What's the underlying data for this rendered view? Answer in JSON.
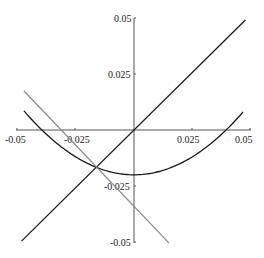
{
  "chart_data": {
    "type": "line",
    "title": "",
    "xlabel": "",
    "ylabel": "",
    "xlim": [
      -0.05,
      0.05
    ],
    "ylim": [
      -0.05,
      0.05
    ],
    "grid": false,
    "legend": null,
    "x_ticks": [
      -0.05,
      -0.025,
      0.025,
      0.05
    ],
    "x_tick_labels": [
      "-0.05",
      "-0.025",
      "0.025",
      "0.05"
    ],
    "y_ticks": [
      0.05,
      0.025,
      -0.025,
      -0.05
    ],
    "y_tick_labels": [
      "0.05",
      "0.025",
      "-0.025",
      "-0.05"
    ],
    "series": [
      {
        "name": "line y = x",
        "color": "#1a1a1a",
        "x": [
          -0.0483,
          0.0478
        ],
        "y": [
          -0.0496,
          0.0491
        ]
      },
      {
        "name": "parabola",
        "color": "#1a1a1a",
        "x": [
          -0.0472,
          -0.04,
          -0.03,
          -0.02,
          -0.0163,
          -0.01,
          0.0,
          0.01,
          0.02,
          0.03,
          0.04,
          0.0472
        ],
        "y": [
          0.0098,
          0.0013,
          -0.0072,
          -0.0146,
          -0.016,
          -0.0185,
          -0.02,
          -0.0185,
          -0.0146,
          -0.0072,
          0.0013,
          0.0082
        ]
      },
      {
        "name": "gray line",
        "color": "#8c8c8c",
        "x": [
          -0.0472,
          0.015
        ],
        "y": [
          0.0174,
          -0.0504
        ]
      }
    ]
  },
  "axes": {
    "x_labels": [
      "-0.05",
      "-0.025",
      "0.025",
      "0.05"
    ],
    "y_labels": [
      "0.05",
      "0.025",
      "-0.025",
      "-0.05"
    ]
  }
}
